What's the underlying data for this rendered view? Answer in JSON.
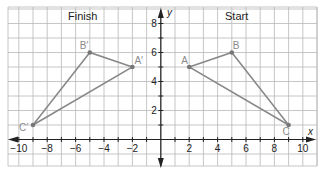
{
  "titles": {
    "left": "Finish",
    "right": "Start"
  },
  "axes": {
    "x_label": "x",
    "y_label": "y",
    "x_ticks": [
      {
        "value": -10,
        "label": "−10"
      },
      {
        "value": -8,
        "label": "−8"
      },
      {
        "value": -6,
        "label": "−6"
      },
      {
        "value": -4,
        "label": "−4"
      },
      {
        "value": -2,
        "label": "−2"
      },
      {
        "value": 2,
        "label": "2"
      },
      {
        "value": 4,
        "label": "4"
      },
      {
        "value": 6,
        "label": "6"
      },
      {
        "value": 8,
        "label": "8"
      },
      {
        "value": 10,
        "label": "10"
      }
    ],
    "y_ticks": [
      {
        "value": 2,
        "label": "2"
      },
      {
        "value": 4,
        "label": "4"
      },
      {
        "value": 6,
        "label": "6"
      },
      {
        "value": 8,
        "label": "8"
      }
    ]
  },
  "colors": {
    "grid": "#b8b8b8",
    "axis": "#222222",
    "triangle": "#888888",
    "vertex_label": "#8a8a8a"
  },
  "triangles": {
    "start": {
      "A": {
        "label": "A",
        "x": 2,
        "y": 5
      },
      "B": {
        "label": "B",
        "x": 5,
        "y": 6
      },
      "C": {
        "label": "C",
        "x": 9,
        "y": 1
      }
    },
    "finish": {
      "A": {
        "label": "A′",
        "x": -2,
        "y": 5
      },
      "B": {
        "label": "B′",
        "x": -5,
        "y": 6
      },
      "C": {
        "label": "C′",
        "x": -9,
        "y": 1
      }
    }
  }
}
